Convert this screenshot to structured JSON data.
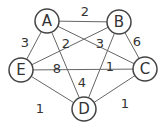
{
  "chart_data": {
    "type": "graph",
    "title": "",
    "nodes": [
      {
        "id": "A",
        "x": 47,
        "y": 21
      },
      {
        "id": "B",
        "x": 119,
        "y": 22
      },
      {
        "id": "C",
        "x": 145,
        "y": 69
      },
      {
        "id": "D",
        "x": 84,
        "y": 109
      },
      {
        "id": "E",
        "x": 21,
        "y": 70
      }
    ],
    "edges": [
      {
        "from": "A",
        "to": "B",
        "weight": "2",
        "lx": 85,
        "ly": 16
      },
      {
        "from": "A",
        "to": "E",
        "weight": "3",
        "lx": 25,
        "ly": 47
      },
      {
        "from": "B",
        "to": "E",
        "weight": "2",
        "lx": 66,
        "ly": 48
      },
      {
        "from": "A",
        "to": "C",
        "weight": "3",
        "lx": 100,
        "ly": 48
      },
      {
        "from": "B",
        "to": "C",
        "weight": "6",
        "lx": 137,
        "ly": 46
      },
      {
        "from": "E",
        "to": "C",
        "weight": "8",
        "lx": 57,
        "ly": 73
      },
      {
        "from": "B",
        "to": "D",
        "weight": "1",
        "lx": 110,
        "ly": 71
      },
      {
        "from": "A",
        "to": "D",
        "weight": "4",
        "lx": 82,
        "ly": 87
      },
      {
        "from": "E",
        "to": "D",
        "weight": "1",
        "lx": 40,
        "ly": 113
      },
      {
        "from": "D",
        "to": "C",
        "weight": "1",
        "lx": 125,
        "ly": 108
      }
    ]
  }
}
